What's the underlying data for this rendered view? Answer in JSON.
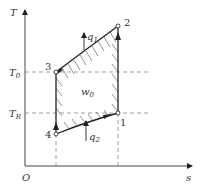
{
  "diagram": {
    "type": "T-s diagram (reverse Carnot / refrigeration cycle)",
    "axes": {
      "y_label": "T",
      "x_label": "s",
      "origin_label": "O"
    },
    "levels": [
      {
        "name": "T0",
        "main": "T",
        "sub": "0"
      },
      {
        "name": "TR",
        "main": "T",
        "sub": "R"
      }
    ],
    "points": [
      {
        "id": "1",
        "label": "1"
      },
      {
        "id": "2",
        "label": "2"
      },
      {
        "id": "3",
        "label": "3"
      },
      {
        "id": "4",
        "label": "4"
      }
    ],
    "heat": [
      {
        "name": "q1",
        "main": "q",
        "sub": "1"
      },
      {
        "name": "q2",
        "main": "q",
        "sub": "2"
      }
    ],
    "work": {
      "main": "w",
      "sub": "0"
    },
    "colors": {
      "line": "#222222",
      "dash": "#777777",
      "hatch": "#555555"
    }
  }
}
